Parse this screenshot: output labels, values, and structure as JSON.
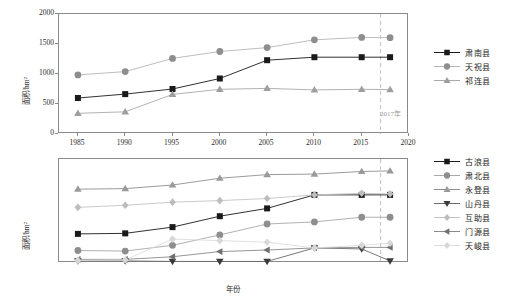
{
  "figure": {
    "axis_label_x": "年份",
    "axis_label_y": "面积/hm²",
    "annotation": "2017年"
  },
  "chart_data": [
    {
      "type": "line",
      "panel": "top",
      "title": "",
      "xlabel": "年份",
      "ylabel": "面积/hm²",
      "xlim": [
        1983,
        2020
      ],
      "ylim": [
        0,
        2000
      ],
      "xticks": [
        1985,
        1990,
        1995,
        2000,
        2005,
        2010,
        2015,
        2020
      ],
      "yticks": [
        0,
        500,
        1000,
        1500,
        2000
      ],
      "grid": false,
      "legend_position": "right",
      "annotations": [
        {
          "text": "2017年",
          "x": 2017,
          "type": "vline-dashed"
        }
      ],
      "x": [
        1985,
        1990,
        1995,
        2000,
        2005,
        2010,
        2015,
        2018
      ],
      "series": [
        {
          "name": "肃南县",
          "marker": "square",
          "color": "#1a1a1a",
          "line": "#1a1a1a",
          "values": [
            600,
            665,
            750,
            925,
            1230,
            1280,
            1280,
            1280
          ]
        },
        {
          "name": "天祝县",
          "marker": "circle",
          "color": "#8e8e8e",
          "line": "#b5b5b5",
          "values": [
            985,
            1040,
            1260,
            1375,
            1440,
            1570,
            1610,
            1605
          ]
        },
        {
          "name": "祁连县",
          "marker": "triangle-up",
          "color": "#9e9e9e",
          "line": "#a8a8a8",
          "values": [
            345,
            370,
            660,
            745,
            760,
            735,
            745,
            740
          ]
        }
      ]
    },
    {
      "type": "line",
      "panel": "bottom",
      "title": "",
      "xlabel": "年份",
      "ylabel": "面积/hm²",
      "xlim": [
        1983,
        2020
      ],
      "ylim": [
        0,
        200
      ],
      "xticks": [
        1985,
        1990,
        1995,
        2000,
        2005,
        2010,
        2015,
        2020
      ],
      "yticks": [
        0,
        50,
        100,
        150,
        200
      ],
      "grid": false,
      "legend_position": "right",
      "annotations": [
        {
          "text": "2017年",
          "x": 2017,
          "type": "vline-dashed"
        }
      ],
      "x": [
        1985,
        1990,
        1995,
        2000,
        2005,
        2010,
        2015,
        2018
      ],
      "series": [
        {
          "name": "古浪县",
          "marker": "square",
          "color": "#1a1a1a",
          "line": "#1a1a1a",
          "values": [
            56,
            57,
            69,
            90,
            105,
            131,
            131,
            131
          ]
        },
        {
          "name": "肃北县",
          "marker": "circle",
          "color": "#8e8e8e",
          "line": "#a8a8a8",
          "values": [
            24,
            23,
            34,
            54,
            75,
            79,
            88,
            88
          ]
        },
        {
          "name": "永登县",
          "marker": "triangle-up",
          "color": "#9a9a9a",
          "line": "#8e8e8e",
          "values": [
            142,
            143,
            150,
            163,
            170,
            171,
            176,
            177
          ]
        },
        {
          "name": "山丹县",
          "marker": "triangle-down",
          "color": "#3a3a3a",
          "line": "#6a6a6a",
          "values": [
            4,
            4,
            3,
            3,
            3,
            29,
            27,
            4
          ]
        },
        {
          "name": "互助县",
          "marker": "diamond",
          "color": "#bdbdbd",
          "line": "#c4c4c4",
          "values": [
            107,
            111,
            117,
            120,
            124,
            131,
            134,
            133
          ]
        },
        {
          "name": "门源县",
          "marker": "triangle-left",
          "color": "#707070",
          "line": "#8a8a8a",
          "values": [
            7,
            7,
            12,
            22,
            25,
            29,
            30,
            30
          ]
        },
        {
          "name": "天峻县",
          "marker": "diamond-light",
          "color": "#d8d8d8",
          "line": "#dcdcdc",
          "values": [
            5,
            6,
            46,
            43,
            40,
            29,
            34,
            38
          ]
        }
      ]
    }
  ]
}
